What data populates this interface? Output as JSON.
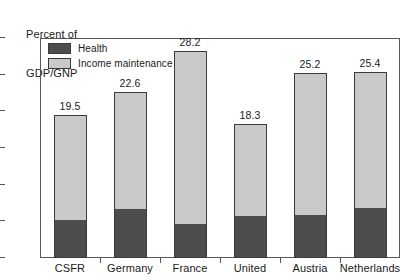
{
  "chart_data": {
    "type": "bar",
    "subtype": "stacked-bar",
    "title": "Percent of GDP/GNP",
    "title_line1": "Percent of",
    "title_line2": "GDP/GNP",
    "xlabel": "",
    "ylabel": "Percent of GDP/GNP",
    "ylim": [
      0,
      30
    ],
    "yticks": [
      0,
      5,
      10,
      15,
      20,
      25,
      30
    ],
    "ytick_labels": [
      "0",
      "5",
      "10",
      "15",
      "20",
      "25",
      "30"
    ],
    "grid": false,
    "legend_position": "upper-left-inside",
    "categories": [
      "CSFR",
      "Germany",
      "France",
      "United",
      "Austria",
      "Netherlands"
    ],
    "series": [
      {
        "name": "Health",
        "color": "#4d4d4d",
        "values": [
          5.2,
          6.7,
          4.7,
          5.7,
          5.9,
          6.8
        ]
      },
      {
        "name": "Income maintenance",
        "color": "#c9c9c9",
        "values": [
          14.3,
          15.9,
          23.5,
          12.6,
          19.3,
          18.6
        ]
      }
    ],
    "totals": [
      19.5,
      22.6,
      28.2,
      18.3,
      25.2,
      25.4
    ],
    "total_labels": [
      "19.5",
      "22.6",
      "28.2",
      "18.3",
      "25.2",
      "25.4"
    ]
  },
  "legend": {
    "items": [
      {
        "label": "Health",
        "swatch": "health-swatch"
      },
      {
        "label": "Income maintenance",
        "swatch": "income-maintenance-swatch"
      }
    ]
  },
  "colors": {
    "health": "#4d4d4d",
    "income_maintenance": "#c9c9c9",
    "axis": "#555555",
    "text": "#1a1a1a",
    "background": "#ffffff"
  }
}
